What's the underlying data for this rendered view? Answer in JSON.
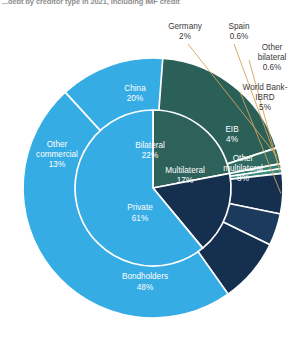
{
  "title": "...debt by creditor type in 2021, including IMF credit",
  "colors": {
    "bilateral_inner": "#2d6159",
    "china": "#2b6058",
    "germany": "#2f6b62",
    "spain": "#358076",
    "other_bilateral": "#3d8c80",
    "multilateral_inner": "#15304f",
    "world_bank": "#15304f",
    "eib": "#1b3a5c",
    "other_multilateral": "#15304f",
    "private_inner": "#36ace4",
    "other_commercial": "#36ace4",
    "bondholders": "#36ace4",
    "separator": "#ffffff",
    "leader_line": "#d6a25a",
    "label_outside": "#3a3a3a",
    "label_inside": "#ffffff",
    "background": "#ffffff"
  },
  "chart_data": {
    "type": "pie",
    "title": "...debt by creditor type in 2021, including IMF credit",
    "xlabel": "",
    "ylabel": "",
    "legend": "none",
    "grid": false,
    "rings": [
      {
        "name": "inner",
        "slices": [
          {
            "label": "Bilateral",
            "value": 22,
            "display": "22%",
            "color": "#2d6159"
          },
          {
            "label": "Multilateral",
            "value": 17,
            "display": "17%",
            "color": "#15304f"
          },
          {
            "label": "Private",
            "value": 61,
            "display": "61%",
            "color": "#36ace4"
          }
        ]
      },
      {
        "name": "outer",
        "slices": [
          {
            "label": "China",
            "value": 20,
            "display": "20%",
            "color": "#2b6058",
            "parent": "Bilateral",
            "leader": false
          },
          {
            "label": "Germany",
            "value": 2,
            "display": "2%",
            "color": "#2f6b62",
            "parent": "Bilateral",
            "leader": true
          },
          {
            "label": "Spain",
            "value": 0.6,
            "display": "0.6%",
            "color": "#358076",
            "parent": "Bilateral",
            "leader": true
          },
          {
            "label": "Other bilateral",
            "value": 0.6,
            "display": "0.6%",
            "color": "#3d8c80",
            "parent": "Bilateral",
            "leader": true
          },
          {
            "label": "World Bank-IBRD",
            "value": 5,
            "display": "5%",
            "color": "#15304f",
            "parent": "Multilateral",
            "leader": true
          },
          {
            "label": "EIB",
            "value": 4,
            "display": "4%",
            "color": "#1b3a5c",
            "parent": "Multilateral",
            "leader": false
          },
          {
            "label": "Other multilateral",
            "value": 8,
            "display": "8%",
            "color": "#15304f",
            "parent": "Multilateral",
            "leader": false
          },
          {
            "label": "Bondholders",
            "value": 48,
            "display": "48%",
            "color": "#36ace4",
            "parent": "Private",
            "leader": false
          },
          {
            "label": "Other commercial",
            "value": 13,
            "display": "13%",
            "color": "#36ace4",
            "parent": "Private",
            "leader": false
          }
        ]
      }
    ]
  },
  "labels": {
    "germany_name": "Germany",
    "germany_pct": "2%",
    "spain_name": "Spain",
    "spain_pct": "0.6%",
    "other_bilateral_l1": "Other",
    "other_bilateral_l2": "bilateral",
    "other_bilateral_pct": "0.6%",
    "world_bank_l1": "World Bank-",
    "world_bank_l2": "IBRD",
    "world_bank_pct": "5%",
    "eib_name": "EIB",
    "eib_pct": "4%",
    "other_multi_l1": "Other",
    "other_multi_l2": "multilateral",
    "other_multi_pct": "8%",
    "china_name": "China",
    "china_pct": "20%",
    "other_comm_l1": "Other",
    "other_comm_l2": "commercial",
    "other_comm_pct": "13%",
    "bondholders_name": "Bondholders",
    "bondholders_pct": "48%",
    "bilateral_name": "Bilateral",
    "bilateral_pct": "22%",
    "multilateral_name": "Multilateral",
    "multilateral_pct": "17%",
    "private_name": "Private",
    "private_pct": "61%"
  }
}
